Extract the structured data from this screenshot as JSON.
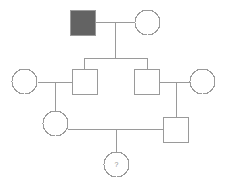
{
  "figure": {
    "kind": "pedigree-chart",
    "width": 228,
    "height": 183,
    "background_color": "#ffffff",
    "line_color": "#9a9a9a",
    "line_width": 1,
    "symbol_stroke_color": "#9a9a9a",
    "affected_fill_color": "#636363",
    "unaffected_fill_color": "#ffffff",
    "label_color": "#8d8d8d"
  },
  "legend_shape_meaning": {
    "square": "male",
    "circle": "female",
    "filled": "affected",
    "open": "unaffected",
    "question_mark": "unknown status"
  },
  "individuals": [
    {
      "id": "I-1",
      "shape": "square",
      "sex": "male",
      "status": "affected",
      "fill": "#636363",
      "label": "",
      "x": 70,
      "y": 10,
      "size": 25,
      "generation": 1
    },
    {
      "id": "I-2",
      "shape": "circle",
      "sex": "female",
      "status": "unaffected",
      "fill": "#ffffff",
      "label": "",
      "x": 135,
      "y": 10,
      "size": 25,
      "generation": 1
    },
    {
      "id": "II-1",
      "shape": "circle",
      "sex": "female",
      "status": "unaffected",
      "fill": "#ffffff",
      "label": "",
      "x": 12,
      "y": 69,
      "size": 25,
      "generation": 2
    },
    {
      "id": "II-2",
      "shape": "square",
      "sex": "male",
      "status": "unaffected",
      "fill": "#ffffff",
      "label": "",
      "x": 72,
      "y": 69,
      "size": 25,
      "generation": 2
    },
    {
      "id": "II-3",
      "shape": "square",
      "sex": "male",
      "status": "unaffected",
      "fill": "#ffffff",
      "label": "",
      "x": 134,
      "y": 69,
      "size": 25,
      "generation": 2
    },
    {
      "id": "II-4",
      "shape": "circle",
      "sex": "female",
      "status": "unaffected",
      "fill": "#ffffff",
      "label": "",
      "x": 190,
      "y": 69,
      "size": 25,
      "generation": 2
    },
    {
      "id": "III-1",
      "shape": "circle",
      "sex": "female",
      "status": "unaffected",
      "fill": "#ffffff",
      "label": "",
      "x": 43,
      "y": 111,
      "size": 25,
      "generation": 3
    },
    {
      "id": "III-2",
      "shape": "square",
      "sex": "male",
      "status": "unaffected",
      "fill": "#ffffff",
      "label": "",
      "x": 163,
      "y": 117,
      "size": 25,
      "generation": 3
    },
    {
      "id": "IV-1",
      "shape": "circle",
      "sex": "female",
      "status": "unknown",
      "fill": "#ffffff",
      "label": "?",
      "x": 104,
      "y": 152,
      "size": 25,
      "generation": 4
    }
  ],
  "matings": [
    {
      "id": "mating-I",
      "partners": [
        "I-1",
        "I-2"
      ],
      "line_y": 22,
      "line_x1": 95,
      "line_x2": 135,
      "descent_x": 115,
      "descent_y2": 58
    },
    {
      "id": "mating-II-left",
      "partners": [
        "II-1",
        "II-2"
      ],
      "line_y": 82,
      "line_x1": 38,
      "line_x2": 72,
      "descent_x": 55,
      "descent_y2": 123
    },
    {
      "id": "mating-II-right",
      "partners": [
        "II-3",
        "II-4"
      ],
      "line_y": 82,
      "line_x1": 159,
      "line_x2": 190,
      "descent_x": 176,
      "descent_y2": 117
    },
    {
      "id": "mating-III",
      "partners": [
        "III-1",
        "III-2"
      ],
      "line_y": 129,
      "line_x1": 68,
      "line_x2": 163,
      "descent_x": 116,
      "descent_y2": 152
    }
  ],
  "sibships": [
    {
      "id": "sibship-II",
      "parents": "mating-I",
      "children": [
        "II-2",
        "II-3"
      ],
      "bar_y": 58,
      "bar_x1": 84,
      "bar_x2": 147,
      "drops": [
        {
          "child": "II-2",
          "x": 84,
          "y2": 69
        },
        {
          "child": "II-3",
          "x": 147,
          "y2": 69
        }
      ]
    },
    {
      "id": "sibship-III-left",
      "parents": "mating-II-left",
      "children": [
        "III-1"
      ],
      "drops": [
        {
          "child": "III-1",
          "x": 55,
          "y2": 111
        }
      ]
    },
    {
      "id": "sibship-III-right",
      "parents": "mating-II-right",
      "children": [
        "III-2"
      ],
      "drops": [
        {
          "child": "III-2",
          "x": 176,
          "y2": 117
        }
      ]
    },
    {
      "id": "sibship-IV",
      "parents": "mating-III",
      "children": [
        "IV-1"
      ],
      "drops": [
        {
          "child": "IV-1",
          "x": 116,
          "y2": 152
        }
      ]
    }
  ]
}
